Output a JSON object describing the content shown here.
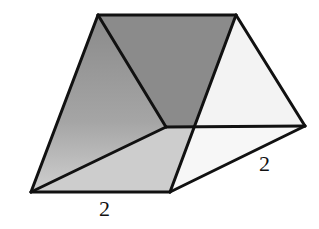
{
  "figure": {
    "type": "triangular prism",
    "labels": [
      {
        "text": "2",
        "position": "bottom front edge"
      },
      {
        "text": "2",
        "position": "right bottom edge"
      }
    ]
  },
  "colors": {
    "edge": "#111111",
    "dark_shade": "#8c8c8c",
    "light_shade": "#d0d0d0",
    "faint_shade": "#f1f1f1",
    "background": "#ffffff"
  }
}
